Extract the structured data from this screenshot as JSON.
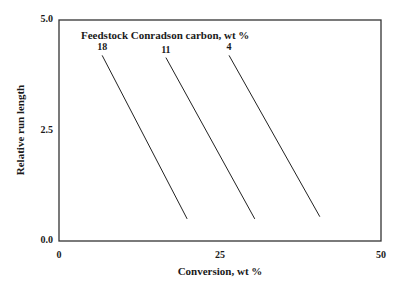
{
  "chart_data": {
    "type": "line",
    "title": "",
    "xlabel": "Conversion, wt %",
    "ylabel": "Relative run length",
    "xlim": [
      0,
      50
    ],
    "ylim": [
      0,
      5
    ],
    "xticks": [
      "0",
      "25",
      "50"
    ],
    "yticks": [
      "0.0",
      "2.5",
      "5.0"
    ],
    "grid": false,
    "legend_title": "Feedstock Conradson carbon, wt %",
    "series": [
      {
        "name": "18",
        "x": [
          6.7,
          19.9
        ],
        "y": [
          4.2,
          0.5
        ]
      },
      {
        "name": "11",
        "x": [
          16.6,
          30.4
        ],
        "y": [
          4.15,
          0.5
        ]
      },
      {
        "name": "4",
        "x": [
          26.4,
          40.5
        ],
        "y": [
          4.2,
          0.55
        ]
      }
    ]
  }
}
